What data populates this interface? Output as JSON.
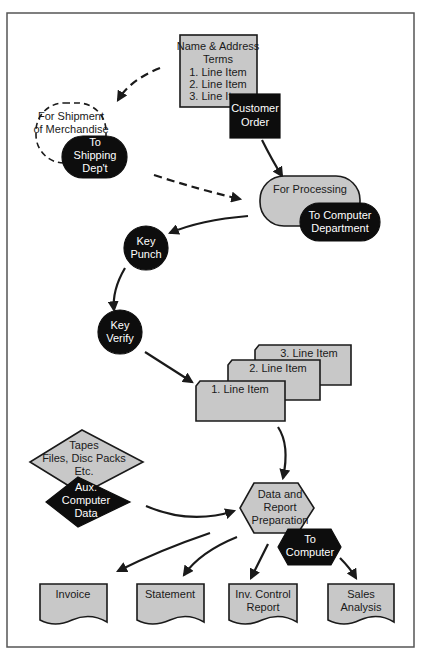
{
  "diagram": {
    "customer_order_doc": {
      "lines": [
        "Name & Address",
        "Terms",
        "1. Line Item",
        "2. Line Item",
        "3. Line Item"
      ]
    },
    "customer_order_label": {
      "lines": [
        "Customer",
        "Order"
      ]
    },
    "shipment_terminal": {
      "lines": [
        "For Shipment",
        "of Merchandise"
      ]
    },
    "shipping_dept": {
      "lines": [
        "To",
        "Shipping",
        "Dep't"
      ]
    },
    "processing_terminal": {
      "label": "For Processing"
    },
    "computer_dept": {
      "lines": [
        "To Computer",
        "Department"
      ]
    },
    "key_punch": {
      "lines": [
        "Key",
        "Punch"
      ]
    },
    "key_verify": {
      "lines": [
        "Key",
        "Verify"
      ]
    },
    "cards": [
      {
        "label": "3. Line Item"
      },
      {
        "label": "2. Line Item"
      },
      {
        "label": "1. Line Item"
      }
    ],
    "aux_storage": {
      "lines": [
        "Tapes",
        "Files, Disc Packs",
        "Etc."
      ]
    },
    "aux_data": {
      "lines": [
        "Aux.",
        "Computer",
        "Data"
      ]
    },
    "data_prep": {
      "lines": [
        "Data and",
        "Report",
        "Preparation"
      ]
    },
    "to_computer": {
      "lines": [
        "To",
        "Computer"
      ]
    },
    "outputs": [
      {
        "lines": [
          "Invoice"
        ]
      },
      {
        "lines": [
          "Statement"
        ]
      },
      {
        "lines": [
          "Inv. Control",
          "Report"
        ]
      },
      {
        "lines": [
          "Sales",
          "Analysis"
        ]
      }
    ],
    "colors": {
      "shape_fill": "#c8c8c8",
      "dark_fill": "#0d0d0d",
      "stroke": "#1a1a1a",
      "frame": "#555555"
    }
  }
}
